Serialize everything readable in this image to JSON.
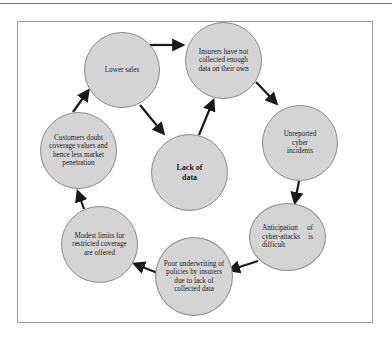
{
  "diagram": {
    "type": "cycle",
    "colors": {
      "node_fill": "#d4d4d4",
      "node_border": "#8a8a8a",
      "arrow": "#1a1a1a",
      "frame": "#9a9a9a"
    },
    "nodes": [
      {
        "id": "lower-sales",
        "label": "Lower sales"
      },
      {
        "id": "insurers",
        "label": "Insurers have not collected enough data on their own"
      },
      {
        "id": "unreported",
        "label": "Unreported cyber incidents"
      },
      {
        "id": "anticipation",
        "label": "Anticipation of cyber-attacks is difficult"
      },
      {
        "id": "poor-underwriting",
        "label": "Poor underwriting of policies by insurers due to lack of collected data"
      },
      {
        "id": "modest-limits",
        "label": "Modest limits for restricted coverage are offered"
      },
      {
        "id": "customers-doubt",
        "label": "Customers doubt coverage values and hence less market penetration"
      },
      {
        "id": "lack-of-data",
        "label": "Lack of data"
      }
    ],
    "edges": [
      {
        "from": "lower-sales",
        "to": "insurers"
      },
      {
        "from": "insurers",
        "to": "unreported"
      },
      {
        "from": "unreported",
        "to": "anticipation"
      },
      {
        "from": "anticipation",
        "to": "poor-underwriting"
      },
      {
        "from": "poor-underwriting",
        "to": "modest-limits"
      },
      {
        "from": "modest-limits",
        "to": "customers-doubt"
      },
      {
        "from": "customers-doubt",
        "to": "lower-sales"
      },
      {
        "from": "lower-sales",
        "to": "lack-of-data"
      },
      {
        "from": "lack-of-data",
        "to": "insurers"
      }
    ]
  }
}
